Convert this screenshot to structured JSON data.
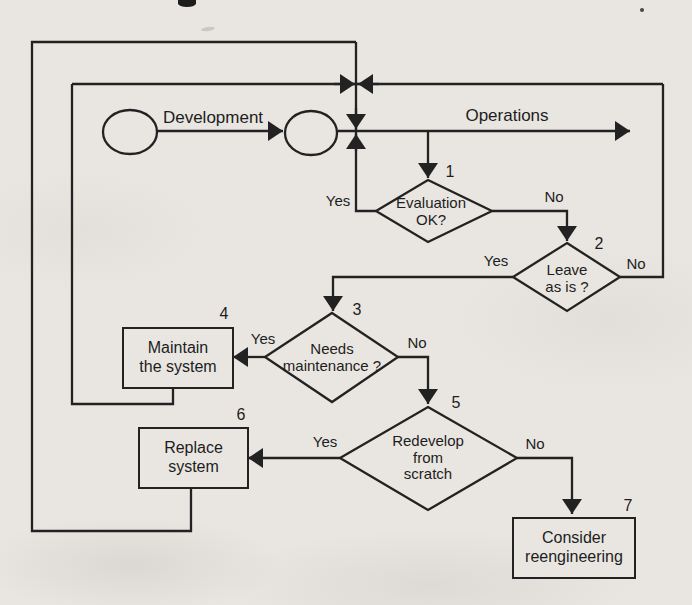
{
  "colors": {
    "ink": "#222222",
    "paper": "#e9e6e1"
  },
  "flow": {
    "development_label": "Development",
    "operations_label": "Operations",
    "decisions": [
      {
        "number": "1",
        "text": "Evaluation\nOK?",
        "yes": "Yes",
        "no": "No"
      },
      {
        "number": "2",
        "text": "Leave\nas is ?",
        "yes": "Yes",
        "no": "No"
      },
      {
        "number": "3",
        "text": "Needs\nmaintenance ?",
        "yes": "Yes",
        "no": "No"
      },
      {
        "number": "5",
        "text": "Redevelop\nfrom\nscratch",
        "yes": "Yes",
        "no": "No"
      }
    ],
    "processes": [
      {
        "number": "4",
        "text": "Maintain\nthe system"
      },
      {
        "number": "6",
        "text": "Replace\nsystem"
      },
      {
        "number": "7",
        "text": "Consider\nreengineering"
      }
    ]
  }
}
